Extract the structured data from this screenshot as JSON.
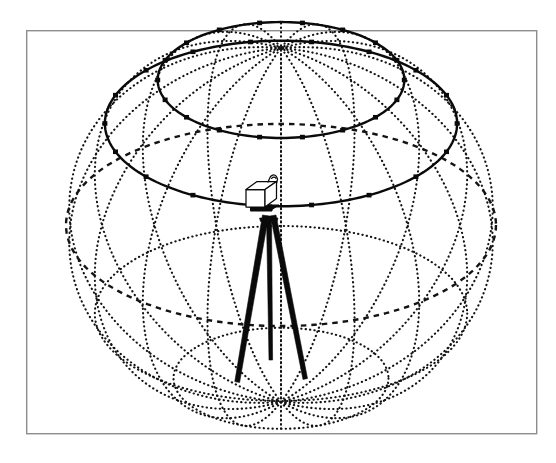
{
  "figure": {
    "caption": "",
    "background_color": "#ffffff",
    "frame": {
      "label": "figure-border",
      "x": 26,
      "y": 30,
      "width": 511,
      "height": 404,
      "stroke_color": "#8d8d8d",
      "stroke_width": 1.4
    },
    "line_color": "#141414",
    "solid_line_color": "#0a0a0a",
    "node_color": "#0a0a0a",
    "instrument_fill": "#ffffff"
  },
  "chart_data": {
    "type": "diagram",
    "subtitle": "",
    "xlabel": "",
    "ylabel": "",
    "grid": true,
    "legend_position": "none",
    "sphere": {
      "label": "celestial-sphere",
      "center_x": 281,
      "center_y": 225,
      "radius_x": 215,
      "radius_y": 177,
      "top_pole_y": 48,
      "bottom_pole_y": 402,
      "left_edge_x": 66,
      "right_edge_x": 496,
      "meridian_count": 18,
      "meridian_step_degrees": 20,
      "meridian_style": "dotted",
      "latitude_dotted_style": "dotted",
      "equator_style": "dashed"
    },
    "latitude_circles": [
      {
        "name": "upper-solid-latitude",
        "declination_deg": 55,
        "style": "solid",
        "nodes": true,
        "node_count": 18
      },
      {
        "name": "lower-solid-latitude",
        "declination_deg": 35,
        "style": "solid",
        "nodes": true,
        "node_count": 18
      },
      {
        "name": "equator",
        "declination_deg": 0,
        "style": "dashed",
        "nodes": false,
        "node_count": 0
      },
      {
        "name": "southern-latitude-1",
        "declination_deg": -30,
        "style": "dotted",
        "nodes": false,
        "node_count": 0
      },
      {
        "name": "southern-latitude-2",
        "declination_deg": -60,
        "style": "dotted",
        "nodes": false,
        "node_count": 0
      }
    ],
    "instrument": {
      "name": "theodolite-total-station",
      "body_shape": "box",
      "body_fill": "#ffffff",
      "has_carry_handle": true,
      "tripod_leg_count": 3,
      "apex_x": 269,
      "apex_y": 217,
      "body_top_y": 182,
      "legs": [
        {
          "name": "left-leg",
          "foot_x": 236,
          "foot_y": 382
        },
        {
          "name": "center-rear-leg",
          "foot_x": 270,
          "foot_y": 360
        },
        {
          "name": "right-leg",
          "foot_x": 305,
          "foot_y": 378
        }
      ]
    }
  }
}
